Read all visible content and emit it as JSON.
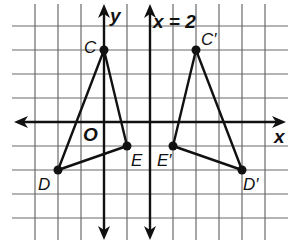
{
  "diagram": {
    "type": "coordinate-plane-reflection",
    "grid": {
      "x_range": [
        -4,
        7
      ],
      "y_range": [
        -5,
        5
      ],
      "origin_px": [
        104,
        122
      ],
      "unit_px": [
        23,
        24
      ]
    },
    "axes": {
      "x_label": "x",
      "y_label": "y",
      "origin_label": "O"
    },
    "line_of_reflection": {
      "label": "x = 2",
      "x": 2
    },
    "original_triangle": {
      "vertices": [
        {
          "name": "C",
          "label": "C",
          "x": 0,
          "y": 3
        },
        {
          "name": "D",
          "label": "D",
          "x": -2,
          "y": -2
        },
        {
          "name": "E",
          "label": "E",
          "x": 1,
          "y": -1
        }
      ]
    },
    "image_triangle": {
      "vertices": [
        {
          "name": "C'",
          "label": "C′",
          "x": 4,
          "y": 3
        },
        {
          "name": "D'",
          "label": "D′",
          "x": 6,
          "y": -2
        },
        {
          "name": "E'",
          "label": "E′",
          "x": 3,
          "y": -1
        }
      ]
    },
    "colors": {
      "ink": "#111111",
      "grid": "#6a6a6a",
      "background": "#ffffff"
    }
  }
}
